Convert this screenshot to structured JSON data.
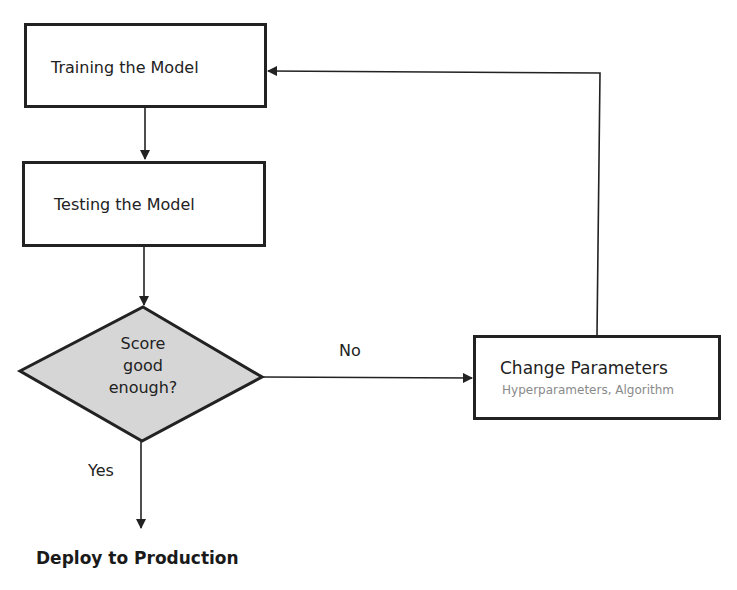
{
  "diagram": {
    "type": "flowchart",
    "nodes": {
      "training": {
        "label": "Training the Model"
      },
      "testing": {
        "label": "Testing the Model"
      },
      "decision": {
        "line1": "Score",
        "line2": "good",
        "line3": "enough?"
      },
      "change": {
        "label": "Change Parameters",
        "sublabel": "Hyperparameters, Algorithm"
      },
      "deploy": {
        "label": "Deploy to Production"
      }
    },
    "edges": {
      "no_label": "No",
      "yes_label": "Yes"
    },
    "colors": {
      "stroke": "#222222",
      "decision_fill": "#d6d6d6",
      "sublabel": "#8a8a8a"
    }
  }
}
